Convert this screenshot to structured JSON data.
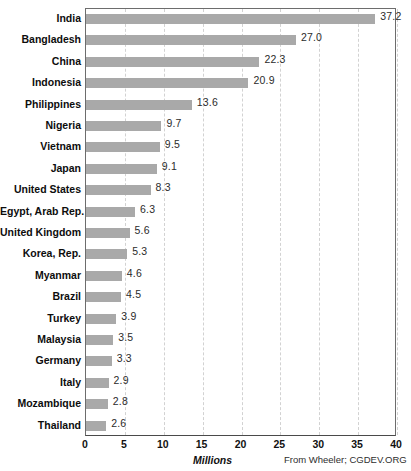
{
  "chart_data": {
    "type": "bar",
    "orientation": "horizontal",
    "title": "",
    "xlabel": "Millions",
    "ylabel": "",
    "xlim": [
      0,
      40
    ],
    "xticks": [
      "0",
      "5",
      "10",
      "15",
      "20",
      "25",
      "30",
      "35",
      "40"
    ],
    "grid": true,
    "legend": null,
    "source_note": "From Wheeler; CGDEV.ORG",
    "categories": [
      "India",
      "Bangladesh",
      "China",
      "Indonesia",
      "Philippines",
      "Nigeria",
      "Vietnam",
      "Japan",
      "United States",
      "Egypt, Arab Rep.",
      "United Kingdom",
      "Korea, Rep.",
      "Myanmar",
      "Brazil",
      "Turkey",
      "Malaysia",
      "Germany",
      "Italy",
      "Mozambique",
      "Thailand"
    ],
    "values": [
      37.2,
      27.0,
      22.3,
      20.9,
      13.6,
      9.7,
      9.5,
      9.1,
      8.3,
      6.3,
      5.6,
      5.3,
      4.6,
      4.5,
      3.9,
      3.5,
      3.3,
      2.9,
      2.8,
      2.6
    ],
    "value_labels": [
      "37.2",
      "27.0",
      "22.3",
      "20.9",
      "13.6",
      "9.7",
      "9.5",
      "9.1",
      "8.3",
      "6.3",
      "5.6",
      "5.3",
      "4.6",
      "4.5",
      "3.9",
      "3.5",
      "3.3",
      "2.9",
      "2.8",
      "2.6"
    ],
    "colors": {
      "bar": "#a9a9a9",
      "gridline": "#d2d2d2",
      "axis": "#6d6d6d",
      "label_text": "#0d0d0d",
      "value_text": "#2b2b2b",
      "background": "#ffffff"
    }
  }
}
